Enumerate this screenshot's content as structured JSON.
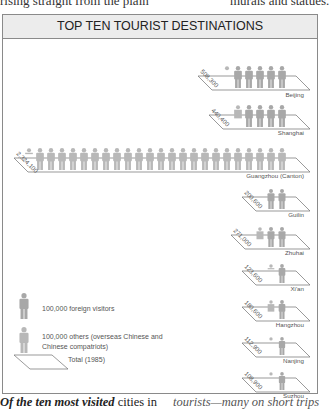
{
  "page": {
    "top_left_text": "rising straight from the plain",
    "top_right_text": "murals and statues.",
    "bottom_left_bold": "Of the ten most visited",
    "bottom_left_rest": " cities in",
    "bottom_right_text": "tourists—many on short trips"
  },
  "chart_data": {
    "type": "pictogram",
    "title": "TOP TEN TOURIST DESTINATIONS",
    "unit": 100000,
    "year": "1985",
    "categories": [
      "Beijing",
      "Shanghai",
      "Guangzhou (Canton)",
      "Guilin",
      "Zhuhai",
      "Xi'an",
      "Hangzhou",
      "Nanjing",
      "Suzhou"
    ],
    "totals_labels": [
      "508,300",
      "440,400",
      "2,324,100",
      "200,600",
      "271,000",
      "123,600",
      "180,600",
      "112,900",
      "108,900"
    ],
    "series": [
      {
        "name": "100,000 foreign visitors",
        "values": [
          5,
          4,
          0,
          2,
          2,
          1,
          1,
          1,
          1
        ]
      },
      {
        "name": "100,000 others (overseas Chinese and Chinese compatriots)",
        "values": [
          0.1,
          0.6,
          23.2,
          0,
          0.7,
          0.2,
          0.8,
          0.1,
          0.1
        ]
      }
    ],
    "legend": [
      {
        "icon": "foreign-visitor",
        "label": "100,000 foreign visitors"
      },
      {
        "icon": "other-visitor",
        "label": "100,000 others (overseas Chinese and Chinese compatriots)"
      },
      {
        "icon": "total-parallelogram",
        "label": "Total (1985)"
      }
    ],
    "colors": {
      "figure": "#a8a8a8",
      "figure_other": "#b8b8b8",
      "line": "#6e6e6e"
    }
  }
}
